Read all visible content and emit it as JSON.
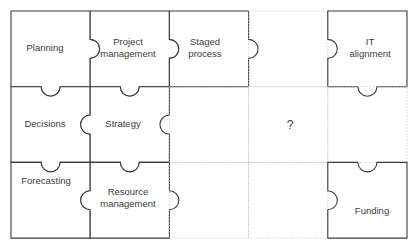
{
  "diagram": {
    "background_color": "#ffffff",
    "piece_stroke_color": "#3b3b3b",
    "empty_cell_stroke_color": "#bdbdbd",
    "text_color": "#3b3b3b",
    "grid": {
      "columns": 5,
      "rows": 3,
      "origin_x": 11,
      "origin_y": 11,
      "cell_width": 79.2,
      "cell_height": 75.7
    },
    "pieces": [
      {
        "id": "planning",
        "label": "Planning",
        "col": 0,
        "row": 0,
        "filled": true,
        "label_x": 20,
        "label_y": 42,
        "label_w": 50,
        "tabs": {
          "top": "flat",
          "right": "tab",
          "bottom": "tab",
          "left": "flat"
        }
      },
      {
        "id": "project-management",
        "label": "Project\nmanagement",
        "col": 1,
        "row": 0,
        "filled": true,
        "label_x": 92,
        "label_y": 36,
        "label_w": 72,
        "tabs": {
          "top": "flat",
          "right": "tab",
          "bottom": "tab",
          "left": "notch"
        }
      },
      {
        "id": "staged-process",
        "label": "Staged\nprocess",
        "col": 2,
        "row": 0,
        "filled": true,
        "label_x": 172,
        "label_y": 36,
        "label_w": 66,
        "tabs": {
          "top": "flat",
          "right": "tab",
          "bottom": "flat",
          "left": "notch"
        }
      },
      {
        "id": "empty-r0c3",
        "label": "",
        "col": 3,
        "row": 0,
        "filled": false,
        "tabs": {
          "top": "flat",
          "right": "flat",
          "bottom": "flat",
          "left": "flat"
        }
      },
      {
        "id": "it-alignment",
        "label": "IT\nalignment",
        "col": 4,
        "row": 0,
        "filled": true,
        "label_x": 337,
        "label_y": 36,
        "label_w": 66,
        "tabs": {
          "top": "flat",
          "right": "flat",
          "bottom": "tab",
          "left": "notch"
        }
      },
      {
        "id": "decisions",
        "label": "Decisions",
        "col": 0,
        "row": 1,
        "filled": true,
        "label_x": 18,
        "label_y": 118,
        "label_w": 54,
        "tabs": {
          "top": "notch",
          "right": "notch",
          "bottom": "tab",
          "left": "flat"
        }
      },
      {
        "id": "strategy",
        "label": "Strategy",
        "col": 1,
        "row": 1,
        "filled": true,
        "label_x": 96,
        "label_y": 118,
        "label_w": 54,
        "tabs": {
          "top": "notch",
          "right": "notch",
          "bottom": "tab",
          "left": "tab"
        }
      },
      {
        "id": "empty-r1c2",
        "label": "",
        "col": 2,
        "row": 1,
        "filled": false,
        "tabs": {
          "top": "flat",
          "right": "flat",
          "bottom": "flat",
          "left": "flat"
        }
      },
      {
        "id": "question-cell",
        "label": "?",
        "col": 3,
        "row": 1,
        "filled": false,
        "label_x": 264,
        "label_y": 118,
        "label_w": 52,
        "tabs": {
          "top": "flat",
          "right": "flat",
          "bottom": "flat",
          "left": "flat"
        }
      },
      {
        "id": "empty-r1c4",
        "label": "",
        "col": 4,
        "row": 1,
        "filled": false,
        "tabs": {
          "top": "flat",
          "right": "flat",
          "bottom": "flat",
          "left": "flat"
        }
      },
      {
        "id": "forecasting",
        "label": "Forecasting",
        "col": 0,
        "row": 2,
        "filled": true,
        "label_x": 16,
        "label_y": 175,
        "label_w": 60,
        "tabs": {
          "top": "notch",
          "right": "notch",
          "bottom": "flat",
          "left": "flat"
        }
      },
      {
        "id": "resource-management",
        "label": "Resource\nmanagement",
        "col": 1,
        "row": 2,
        "filled": true,
        "label_x": 92,
        "label_y": 186,
        "label_w": 72,
        "tabs": {
          "top": "notch",
          "right": "tab",
          "bottom": "flat",
          "left": "tab"
        }
      },
      {
        "id": "empty-r2c2",
        "label": "",
        "col": 2,
        "row": 2,
        "filled": false,
        "tabs": {
          "top": "flat",
          "right": "flat",
          "bottom": "flat",
          "left": "flat"
        }
      },
      {
        "id": "empty-r2c3",
        "label": "",
        "col": 3,
        "row": 2,
        "filled": false,
        "tabs": {
          "top": "flat",
          "right": "flat",
          "bottom": "flat",
          "left": "flat"
        }
      },
      {
        "id": "funding",
        "label": "Funding",
        "col": 4,
        "row": 2,
        "filled": true,
        "label_x": 341,
        "label_y": 205,
        "label_w": 62,
        "tabs": {
          "top": "notch",
          "right": "flat",
          "bottom": "flat",
          "left": "notch"
        }
      }
    ]
  }
}
